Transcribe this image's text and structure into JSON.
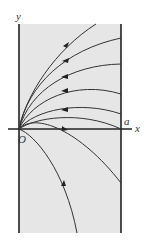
{
  "figure": {
    "type": "trajectory-diagram",
    "colors": {
      "region_fill": "#e6e6e6",
      "line": "#333333",
      "background": "#ffffff"
    },
    "labels": {
      "y_axis": "y",
      "x_axis": "x",
      "origin": "O",
      "right_boundary": "a"
    },
    "region": {
      "description": "shaded strip between x=0 and x=a"
    },
    "trajectory_count": 8
  }
}
